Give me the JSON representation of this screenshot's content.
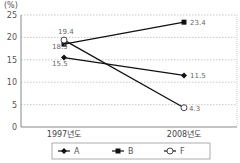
{
  "chart_data": {
    "type": "line",
    "title": "",
    "ylabel": "(%)",
    "xlabel": "",
    "ylim": [
      0,
      25
    ],
    "yticks": [
      0,
      5,
      10,
      15,
      20,
      25
    ],
    "grid": true,
    "legend_position": "bottom",
    "categories": [
      "1997년도",
      "2008년도"
    ],
    "series": [
      {
        "name": "A",
        "marker": "diamond-filled",
        "values": [
          15.5,
          11.5
        ]
      },
      {
        "name": "B",
        "marker": "square-filled",
        "values": [
          18.5,
          23.4
        ]
      },
      {
        "name": "F",
        "marker": "circle-open",
        "values": [
          19.4,
          4.3
        ]
      }
    ]
  }
}
